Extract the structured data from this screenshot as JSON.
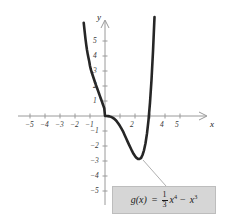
{
  "chart_data": {
    "type": "line",
    "title": "",
    "xlabel": "x",
    "ylabel": "y",
    "function_latex": "g(x) = (1/3)x^4 - x^3",
    "xlim": [
      -5.8,
      6.2
    ],
    "ylim": [
      -5.6,
      6.3
    ],
    "xticks": [
      -5,
      -4,
      -3,
      -2,
      -1,
      1,
      2,
      3,
      4,
      5
    ],
    "yticks": [
      -5,
      -4,
      -3,
      -2,
      -1,
      1,
      2,
      3,
      4,
      5
    ],
    "xtick_labels": [
      "-5",
      "-4",
      "-3",
      "-2",
      "-1",
      "1",
      "2",
      "3",
      "4",
      "5"
    ],
    "ytick_labels": [
      "-5",
      "-4",
      "-3",
      "-2",
      "-1",
      "1",
      "2",
      "3",
      "4",
      "5"
    ],
    "grid": false,
    "legend": "none",
    "series": [
      {
        "name": "g(x) = (1/3)x^4 - x^3",
        "color": "#262626",
        "x_domain": [
          -1.42,
          3.52
        ],
        "x": [
          -1.42,
          -1.35,
          -1.3,
          -1.25,
          -1.2,
          -1.15,
          -1.1,
          -1.05,
          -1.0,
          -0.95,
          -0.9,
          -0.85,
          -0.8,
          -0.75,
          -0.7,
          -0.65,
          -0.6,
          -0.55,
          -0.5,
          -0.45,
          -0.4,
          -0.35,
          -0.3,
          -0.25,
          -0.2,
          -0.15,
          -0.1,
          -0.05,
          0.0,
          0.1,
          0.2,
          0.3,
          0.4,
          0.5,
          0.6,
          0.7,
          0.8,
          0.9,
          1.0,
          1.1,
          1.2,
          1.3,
          1.4,
          1.5,
          1.6,
          1.7,
          1.8,
          1.9,
          2.0,
          2.1,
          2.2,
          2.25,
          2.3,
          2.4,
          2.5,
          2.6,
          2.7,
          2.8,
          2.9,
          3.0,
          3.1,
          3.2,
          3.3,
          3.4,
          3.5,
          3.52
        ],
        "y": [
          6.22,
          5.57,
          5.13,
          4.74,
          4.4,
          4.11,
          3.86,
          3.63,
          3.33,
          3.12,
          2.95,
          2.8,
          2.65,
          2.5,
          2.35,
          2.2,
          2.06,
          1.92,
          1.78,
          1.64,
          1.5,
          1.36,
          1.22,
          1.08,
          0.94,
          0.8,
          0.66,
          0.52,
          0.0,
          -0.001,
          -0.008,
          -0.024,
          -0.057,
          -0.104,
          -0.173,
          -0.262,
          -0.38,
          -0.52,
          -0.67,
          -0.84,
          -1.02,
          -1.25,
          -1.47,
          -1.69,
          -1.91,
          -2.12,
          -2.33,
          -2.52,
          -2.67,
          -2.79,
          -2.86,
          -2.87,
          -2.86,
          -2.81,
          -2.6,
          -2.29,
          -1.82,
          -1.16,
          -0.27,
          0.89,
          2.4,
          4.3,
          6.6,
          9.36,
          12.6,
          13.3
        ]
      }
    ],
    "annotations": [
      {
        "name": "formula-callout",
        "text": "g(x) = (1/3)x^4 - x^3",
        "points_to": {
          "x": 2.4,
          "y": -3.1
        }
      }
    ]
  },
  "axes": {
    "x_axis_label": "x",
    "y_axis_label": "y",
    "x_tick_labels": [
      {
        "value": -5,
        "text": "−5"
      },
      {
        "value": -4,
        "text": "−4"
      },
      {
        "value": -3,
        "text": "−3"
      },
      {
        "value": -2,
        "text": "−2"
      },
      {
        "value": -1,
        "text": "−1"
      },
      {
        "value": 2,
        "text": "2"
      },
      {
        "value": 4,
        "text": "4"
      },
      {
        "value": 5,
        "text": "5"
      }
    ],
    "y_tick_labels": [
      {
        "value": 5,
        "text": "5"
      },
      {
        "value": 4,
        "text": "4"
      },
      {
        "value": 3,
        "text": "3"
      },
      {
        "value": 2,
        "text": "2"
      },
      {
        "value": 1,
        "text": "1"
      },
      {
        "value": -1,
        "text": "−1"
      },
      {
        "value": -2,
        "text": "−2"
      },
      {
        "value": -3,
        "text": "−3"
      },
      {
        "value": -4,
        "text": "−4"
      },
      {
        "value": -5,
        "text": "−5"
      }
    ]
  },
  "formula": {
    "lhs": "g(x)",
    "equals": "=",
    "numerator": "1",
    "denominator": "3",
    "term1_base": "x",
    "term1_exp": "4",
    "operator": "−",
    "term2_base": "x",
    "term2_exp": "3"
  },
  "colors": {
    "curve": "#262626",
    "axis": "#9a9a9a",
    "box_fill": "#d6d6d6",
    "box_border": "#bdbdbd",
    "background": "#ffffff",
    "text": "#1a1a1a"
  }
}
